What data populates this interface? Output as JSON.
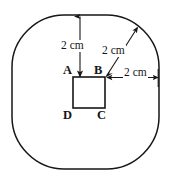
{
  "figure": {
    "stroke_color": "#161616",
    "background_color": "#ffffff",
    "vertices": [
      {
        "id": "A",
        "label": "A",
        "position": "top-left"
      },
      {
        "id": "B",
        "label": "B",
        "position": "top-right"
      },
      {
        "id": "C",
        "label": "C",
        "position": "bottom-right"
      },
      {
        "id": "D",
        "label": "D",
        "position": "bottom-left"
      }
    ],
    "dimensions": [
      {
        "id": "top",
        "label": "2 cm",
        "direction": "vertical",
        "from": "A-B edge",
        "to": "outer boundary top"
      },
      {
        "id": "corner",
        "label": "2 cm",
        "direction": "diagonal",
        "from": "B",
        "to": "outer boundary corner"
      },
      {
        "id": "right",
        "label": "2 cm",
        "direction": "horizontal",
        "from": "B",
        "to": "outer boundary right"
      }
    ],
    "inner_square": {
      "name": "ABCD",
      "x": 73,
      "y": 77,
      "width": 32,
      "height": 31
    },
    "outer_shape": {
      "type": "rounded-square",
      "x": 12,
      "y": 15,
      "width": 147,
      "height": 154,
      "corner_radius": 52
    }
  }
}
